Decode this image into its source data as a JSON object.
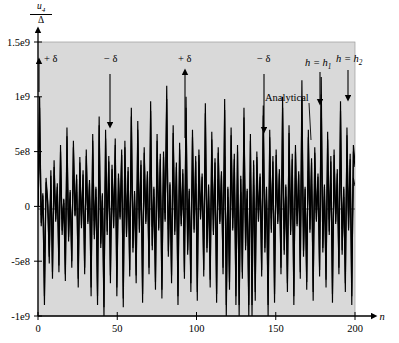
{
  "chart_data": {
    "type": "line",
    "title": "",
    "xlabel": "n",
    "ylabel": "u_4 / Delta",
    "ylabel_numerator": "u",
    "ylabel_numerator_sub": "4",
    "ylabel_denominator": "Δ",
    "xlim": [
      0,
      200
    ],
    "ylim": [
      -1000000000,
      1500000000
    ],
    "grid": false,
    "legend_position": "none",
    "background_color": "#d9d9d9",
    "line_color": "#000000",
    "zero_line": {
      "value": 0,
      "style": "dashed"
    },
    "xticks": [
      0,
      50,
      100,
      150,
      200
    ],
    "xticklabels": [
      "0",
      "50",
      "100",
      "150",
      "200"
    ],
    "yticks": [
      -1000000000,
      -500000000,
      0,
      500000000,
      1000000000,
      1500000000
    ],
    "yticklabels": [
      "-1e9",
      "-5e8",
      "0",
      "5e8",
      "1e9",
      "1.5e9"
    ],
    "series": [
      {
        "name": "Analytical",
        "values": [
          0,
          1000000000,
          -180000000,
          120000000,
          -900000000,
          260000000,
          60000000,
          -520000000,
          330000000,
          -660000000,
          420000000,
          -140000000,
          210000000,
          -600000000,
          560000000,
          -260000000,
          70000000,
          -680000000,
          720000000,
          -320000000,
          150000000,
          -560000000,
          600000000,
          -90000000,
          290000000,
          -740000000,
          450000000,
          -200000000,
          330000000,
          -620000000,
          520000000,
          -160000000,
          240000000,
          -820000000,
          660000000,
          -300000000,
          180000000,
          -900000000,
          820000000,
          -380000000,
          120000000,
          -1000000000,
          700000000,
          -260000000,
          460000000,
          -700000000,
          380000000,
          -200000000,
          620000000,
          -820000000,
          300000000,
          -120000000,
          520000000,
          -920000000,
          600000000,
          -280000000,
          360000000,
          -640000000,
          900000000,
          -420000000,
          140000000,
          -700000000,
          780000000,
          -240000000,
          420000000,
          -880000000,
          540000000,
          -160000000,
          320000000,
          -620000000,
          960000000,
          -400000000,
          180000000,
          -760000000,
          660000000,
          -220000000,
          480000000,
          -840000000,
          500000000,
          -140000000,
          1100000000,
          -460000000,
          220000000,
          -700000000,
          740000000,
          -260000000,
          400000000,
          -900000000,
          580000000,
          -180000000,
          340000000,
          -660000000,
          1000000000,
          -440000000,
          160000000,
          -780000000,
          700000000,
          -240000000,
          460000000,
          -860000000,
          520000000,
          -120000000,
          300000000,
          -640000000,
          940000000,
          -420000000,
          200000000,
          -740000000,
          680000000,
          -260000000,
          440000000,
          -880000000,
          540000000,
          -160000000,
          320000000,
          -620000000,
          980000000,
          -1000000000,
          180000000,
          -760000000,
          720000000,
          -220000000,
          480000000,
          -900000000,
          560000000,
          -1000000000,
          280000000,
          -660000000,
          900000000,
          -400000000,
          160000000,
          -1000000000,
          660000000,
          -1000000000,
          420000000,
          -860000000,
          500000000,
          -140000000,
          300000000,
          -640000000,
          920000000,
          -420000000,
          180000000,
          -1000000000,
          700000000,
          -240000000,
          460000000,
          -880000000,
          520000000,
          -160000000,
          340000000,
          -620000000,
          1000000000,
          -440000000,
          200000000,
          -780000000,
          740000000,
          -260000000,
          480000000,
          -900000000,
          560000000,
          -180000000,
          320000000,
          -660000000,
          1150000000,
          -460000000,
          180000000,
          -760000000,
          700000000,
          -240000000,
          440000000,
          -860000000,
          540000000,
          -140000000,
          300000000,
          -640000000,
          1180000000,
          -420000000,
          200000000,
          -740000000,
          680000000,
          -260000000,
          460000000,
          -880000000,
          520000000,
          -160000000,
          340000000,
          -620000000,
          960000000,
          -440000000,
          180000000,
          -780000000,
          720000000,
          -220000000,
          480000000,
          -900000000,
          560000000,
          400000000
        ]
      },
      {
        "name": "h = h_1",
        "values": [
          0,
          900000000,
          -150000000,
          100000000,
          -820000000,
          220000000,
          40000000,
          -460000000,
          280000000,
          -600000000,
          360000000,
          -120000000,
          180000000,
          -540000000,
          500000000,
          -220000000,
          60000000,
          -620000000,
          640000000,
          -280000000,
          130000000,
          -500000000,
          540000000,
          -80000000,
          250000000,
          -660000000,
          400000000,
          -170000000,
          290000000,
          -560000000,
          460000000,
          -140000000,
          210000000,
          -740000000,
          600000000,
          -260000000,
          160000000,
          -820000000,
          740000000,
          -340000000,
          100000000,
          -920000000,
          620000000,
          -230000000,
          410000000,
          -630000000,
          340000000,
          -180000000,
          560000000,
          -740000000,
          260000000,
          -100000000,
          470000000,
          -840000000,
          540000000,
          -250000000,
          320000000,
          -580000000,
          820000000,
          -380000000,
          120000000,
          -630000000,
          700000000,
          -210000000,
          380000000,
          -800000000,
          490000000,
          -140000000,
          290000000,
          -560000000,
          870000000,
          -360000000,
          160000000,
          -690000000,
          600000000,
          -200000000,
          430000000,
          -760000000,
          450000000,
          -120000000,
          980000000,
          -410000000,
          200000000,
          -630000000,
          670000000,
          -230000000,
          360000000,
          -820000000,
          520000000,
          -160000000,
          300000000,
          -600000000,
          900000000,
          -400000000,
          140000000,
          -700000000,
          630000000,
          -210000000,
          410000000,
          -780000000,
          470000000,
          -100000000,
          270000000,
          -580000000,
          850000000,
          -380000000,
          180000000,
          -670000000,
          610000000,
          -230000000,
          400000000,
          -800000000,
          490000000,
          -140000000,
          290000000,
          -560000000,
          880000000,
          -900000000,
          160000000,
          -690000000,
          650000000,
          -200000000,
          430000000,
          -820000000,
          500000000,
          -900000000,
          250000000,
          -600000000,
          810000000,
          -360000000,
          140000000,
          -900000000,
          600000000,
          -900000000,
          380000000,
          -780000000,
          450000000,
          -120000000,
          270000000,
          -580000000,
          830000000,
          -380000000,
          160000000,
          -900000000,
          630000000,
          -210000000,
          410000000,
          -800000000,
          470000000,
          -140000000,
          300000000,
          -560000000,
          900000000,
          -400000000,
          180000000,
          -700000000,
          670000000,
          -230000000,
          430000000,
          -820000000,
          500000000,
          -160000000,
          290000000,
          -600000000,
          1000000000,
          -410000000,
          160000000,
          -690000000,
          630000000,
          -210000000,
          400000000,
          -780000000,
          490000000,
          -120000000,
          270000000,
          -580000000,
          1020000000,
          -380000000,
          180000000,
          -670000000,
          610000000,
          -230000000,
          410000000,
          -800000000,
          470000000,
          -140000000,
          300000000,
          -560000000,
          870000000,
          -400000000,
          160000000,
          -700000000,
          650000000,
          -200000000,
          430000000,
          -820000000,
          500000000,
          360000000
        ]
      },
      {
        "name": "h = h_2",
        "values": [
          0,
          480000000,
          -80000000,
          60000000,
          -420000000,
          120000000,
          20000000,
          -240000000,
          150000000,
          -310000000,
          190000000,
          -60000000,
          95000000,
          -280000000,
          260000000,
          -115000000,
          30000000,
          -320000000,
          330000000,
          -145000000,
          70000000,
          -260000000,
          280000000,
          -40000000,
          130000000,
          -340000000,
          210000000,
          -90000000,
          150000000,
          -290000000,
          240000000,
          -70000000,
          110000000,
          -380000000,
          310000000,
          -135000000,
          85000000,
          -420000000,
          380000000,
          -175000000,
          55000000,
          -470000000,
          320000000,
          -120000000,
          210000000,
          -325000000,
          175000000,
          -95000000,
          290000000,
          -380000000,
          135000000,
          -50000000,
          240000000,
          -430000000,
          280000000,
          -130000000,
          165000000,
          -300000000,
          420000000,
          -195000000,
          60000000,
          -325000000,
          360000000,
          -110000000,
          195000000,
          -410000000,
          250000000,
          -70000000,
          150000000,
          -290000000,
          450000000,
          -185000000,
          85000000,
          -355000000,
          310000000,
          -105000000,
          220000000,
          -390000000,
          230000000,
          -60000000,
          500000000,
          -210000000,
          100000000,
          -325000000,
          345000000,
          -120000000,
          185000000,
          -420000000,
          270000000,
          -85000000,
          155000000,
          -310000000,
          465000000,
          -205000000,
          70000000,
          -360000000,
          325000000,
          -110000000,
          210000000,
          -400000000,
          240000000,
          -50000000,
          140000000,
          -300000000,
          440000000,
          -195000000,
          90000000,
          -345000000,
          315000000,
          -120000000,
          205000000,
          -410000000,
          250000000,
          -70000000,
          150000000,
          -290000000,
          455000000,
          -465000000,
          85000000,
          -355000000,
          335000000,
          -105000000,
          220000000,
          -420000000,
          260000000,
          -465000000,
          130000000,
          -310000000,
          420000000,
          -185000000,
          70000000,
          -465000000,
          310000000,
          -465000000,
          195000000,
          -400000000,
          230000000,
          -60000000,
          140000000,
          -300000000,
          430000000,
          -195000000,
          85000000,
          -465000000,
          325000000,
          -110000000,
          210000000,
          -410000000,
          240000000,
          -70000000,
          155000000,
          -290000000,
          465000000,
          -205000000,
          90000000,
          -360000000,
          345000000,
          -120000000,
          220000000,
          -420000000,
          260000000,
          -85000000,
          150000000,
          -310000000,
          520000000,
          -210000000,
          85000000,
          -355000000,
          325000000,
          -110000000,
          205000000,
          -400000000,
          250000000,
          -60000000,
          140000000,
          -300000000,
          530000000,
          -195000000,
          90000000,
          -345000000,
          315000000,
          -120000000,
          210000000,
          -410000000,
          240000000,
          -70000000,
          155000000,
          -290000000,
          450000000,
          -205000000,
          85000000,
          -360000000,
          335000000,
          -105000000,
          220000000,
          -420000000,
          260000000,
          185000000
        ]
      }
    ],
    "annotations": [
      {
        "id": "plus-delta-1",
        "label": "+ δ",
        "arrow": "up",
        "x_text": 44,
        "y_text": 62,
        "x_arrow": 39,
        "y_arrow_tail": 92,
        "y_arrow_head": 61
      },
      {
        "id": "minus-delta-1",
        "label": "− δ",
        "arrow": "down",
        "x_text": 104,
        "y_text": 62,
        "x_arrow": 110,
        "y_arrow_tail": 74,
        "y_arrow_head": 125
      },
      {
        "id": "plus-delta-2",
        "label": "+ δ",
        "arrow": "up",
        "x_text": 178,
        "y_text": 62,
        "x_arrow": 185,
        "y_arrow_tail": 138,
        "y_arrow_head": 72
      },
      {
        "id": "minus-delta-2",
        "label": "− δ",
        "arrow": "down",
        "x_text": 257,
        "y_text": 62,
        "x_arrow": 264,
        "y_arrow_tail": 74,
        "y_arrow_head": 130
      },
      {
        "id": "analytical",
        "label": "Analytical",
        "arrow": "leader",
        "x_text": 265,
        "y_text": 101,
        "x_arrow": 311,
        "y_arrow_tail": 104,
        "y_arrow_head": 140
      },
      {
        "id": "h-equals-h1",
        "label": "h = h",
        "sub": "1",
        "arrow": "down",
        "x_text": 305,
        "y_text": 66,
        "x_arrow": 320,
        "y_arrow_tail": 72,
        "y_arrow_head": 102
      },
      {
        "id": "h-equals-h2",
        "label": "h = h",
        "sub": "2",
        "arrow": "down",
        "x_text": 336,
        "y_text": 62,
        "x_arrow": 348,
        "y_arrow_tail": 70,
        "y_arrow_head": 98
      }
    ]
  },
  "axes": {
    "plot_left": 38,
    "plot_right": 355,
    "plot_top": 42,
    "plot_bottom": 316,
    "x_axis_arrow_label": "n"
  }
}
